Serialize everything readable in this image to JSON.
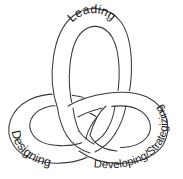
{
  "diagram": {
    "type": "trefoil-knot",
    "background_color": "#ffffff",
    "stroke_color": "#3a3a3a",
    "text_color": "#1a1a1a",
    "labels": {
      "top": "Leading",
      "bottom_left": "Designing",
      "bottom_right": "Developing/Strategizing"
    }
  }
}
